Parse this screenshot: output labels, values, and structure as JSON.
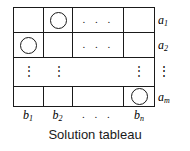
{
  "figure": {
    "caption": "Solution tableau",
    "line_color": "#1a1a1a",
    "background_color": "#ffffff"
  },
  "grid": {
    "rows": 4,
    "columns": 4,
    "column_labels": [
      "b₁",
      "b₂",
      ". . .",
      "bₙ"
    ],
    "row_labels": [
      "a₁",
      "a₂",
      "⋮",
      "aₘ"
    ],
    "ellipsis_horizontal": ". . .",
    "ellipsis_vertical": "⋮",
    "cells": [
      [
        {
          "mark": "",
          "name": "cell-r1-c1"
        },
        {
          "mark": "circle",
          "name": "cell-r1-c2"
        },
        {
          "mark": "hdots",
          "name": "cell-r1-cdots"
        },
        {
          "mark": "",
          "name": "cell-r1-cn"
        }
      ],
      [
        {
          "mark": "circle",
          "name": "cell-r2-c1"
        },
        {
          "mark": "",
          "name": "cell-r2-c2"
        },
        {
          "mark": "hdots",
          "name": "cell-r2-cdots"
        },
        {
          "mark": "",
          "name": "cell-r2-cn"
        }
      ],
      [
        {
          "mark": "vdots",
          "name": "cell-r3-c1"
        },
        {
          "mark": "vdots",
          "name": "cell-r3-c2"
        },
        {
          "mark": "",
          "name": "cell-r3-cdots"
        },
        {
          "mark": "vdots",
          "name": "cell-r3-cn"
        }
      ],
      [
        {
          "mark": "",
          "name": "cell-rm-c1"
        },
        {
          "mark": "",
          "name": "cell-rm-c2"
        },
        {
          "mark": "",
          "name": "cell-rm-cdots"
        },
        {
          "mark": "circle",
          "name": "cell-rm-cn"
        }
      ]
    ]
  },
  "labels": {
    "a1_base": "a",
    "a1_sub": "1",
    "a2_base": "a",
    "a2_sub": "2",
    "a_vdots": "⋮",
    "am_base": "a",
    "am_sub": "m",
    "b1_base": "b",
    "b1_sub": "1",
    "b2_base": "b",
    "b2_sub": "2",
    "b_hdots": ". . .",
    "bn_base": "b",
    "bn_sub": "n"
  }
}
